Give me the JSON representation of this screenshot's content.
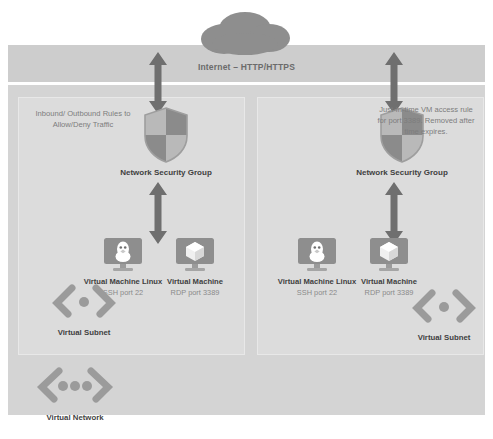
{
  "diagram": {
    "internet": {
      "label": "Internet – HTTP/HTTPS",
      "cloud_icon": "cloud-icon"
    },
    "colors": {
      "band": "#cdcdcd",
      "vnet": "#d4d4d4",
      "subnet_panel": "#dcdcdc",
      "icon_grey": "#8e8e8e",
      "icon_dark": "#6f6f6f",
      "text_dark": "#3f3f3f",
      "text_muted": "#8a8a8a"
    },
    "zones": [
      {
        "id": "left",
        "note": "Inbound/ Outbound Rules to Allow/Deny Traffic",
        "nsg_label": "Network Security Group",
        "nsg_icon": "shield-icon",
        "subnet_label": "Virtual Subnet",
        "subnet_icon": "virtual-subnet-icon",
        "vms": [
          {
            "title": "Virtual Machine Linux",
            "icon": "linux-penguin-vm-icon",
            "port": "SSH port 22"
          },
          {
            "title": "Virtual Machine",
            "icon": "windows-cube-vm-icon",
            "port": "RDP port 3389"
          }
        ]
      },
      {
        "id": "right",
        "note": "Just-In-time VM access rule for port 3389. Removed after time expires.",
        "nsg_label": "Network Security Group",
        "nsg_icon": "shield-icon",
        "subnet_label": "Virtual Subnet",
        "subnet_icon": "virtual-subnet-icon",
        "vms": [
          {
            "title": "Virtual Machine Linux",
            "icon": "linux-penguin-vm-icon",
            "port": "SSH port 22"
          },
          {
            "title": "Virtual Machine",
            "icon": "windows-cube-vm-icon",
            "port": "RDP port 3389"
          }
        ]
      }
    ],
    "virtual_network": {
      "label": "Virtual Network",
      "icon": "virtual-network-icon"
    },
    "arrows": [
      {
        "name": "internet-to-nsg-left",
        "direction": "bidirectional"
      },
      {
        "name": "internet-to-nsg-right",
        "direction": "bidirectional"
      },
      {
        "name": "nsg-to-vms-left",
        "direction": "bidirectional"
      },
      {
        "name": "nsg-to-vms-right",
        "direction": "bidirectional"
      }
    ]
  }
}
